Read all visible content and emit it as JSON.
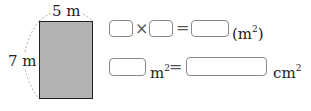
{
  "figure": {
    "width_label": "5 m",
    "height_label": "7 m",
    "fill_color": "#b3b3b3"
  },
  "row1": {
    "times": "×",
    "equals": "=",
    "unit": "(m",
    "unit_exp": "2",
    "unit_close": ")"
  },
  "row2": {
    "unit1": "m",
    "unit1_exp": "2",
    "equals": "=",
    "unit2": "cm",
    "unit2_exp": "2"
  }
}
